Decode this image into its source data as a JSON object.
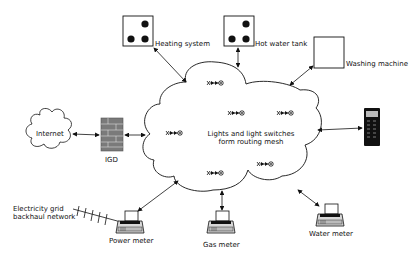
{
  "diagram": {
    "center": {
      "label_line1": "Lights and light switches",
      "label_line2": "form routing mesh"
    },
    "nodes": {
      "heating": {
        "label": "Heating system"
      },
      "hot_water": {
        "label": "Hot water tank"
      },
      "washing": {
        "label": "Washing machine"
      },
      "internet": {
        "label": "Internet"
      },
      "igd": {
        "label": "IGD"
      },
      "phone": {
        "label": ""
      },
      "grid_line1": {
        "label": "Electricity grid"
      },
      "grid_line2": {
        "label": "backhaul network"
      },
      "power": {
        "label": "Power meter"
      },
      "gas": {
        "label": "Gas meter"
      },
      "water": {
        "label": "Water meter"
      }
    },
    "icons": {
      "mesh_node": "light-switch-icon",
      "device_box": "device-box-icon",
      "meter": "meter-printer-icon",
      "firewall": "brick-wall-icon",
      "phone": "mobile-phone-icon",
      "cloud": "cloud-icon",
      "antenna": "antenna-icon"
    },
    "colors": {
      "stroke": "#111111",
      "brick": "#7a7a7a",
      "background": "#ffffff"
    }
  }
}
